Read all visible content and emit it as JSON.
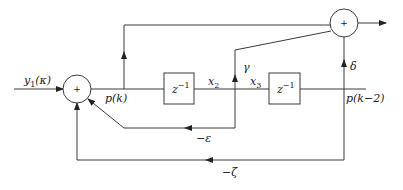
{
  "diagram": {
    "type": "block-diagram",
    "nodes": {
      "sum1": {
        "symbol": "+"
      },
      "sum2": {
        "symbol": "+"
      },
      "delay1": {
        "label_base": "z",
        "label_exp": "−1"
      },
      "delay2": {
        "label_base": "z",
        "label_exp": "−1"
      }
    },
    "labels": {
      "input": "y1(κ)",
      "input_base": "y",
      "input_sub": "1",
      "input_arg": "(κ)",
      "pk": "p(k)",
      "x2_base": "x",
      "x2_sub": "2",
      "x3_base": "x",
      "x3_sub": "3",
      "gamma": "γ",
      "delta": "δ",
      "pk2": "p(k−2)",
      "epsilon": "−ε",
      "zeta": "−ζ"
    },
    "edges": [
      {
        "from": "input",
        "to": "sum1"
      },
      {
        "from": "sum1",
        "to": "delay1",
        "label": "p(k)"
      },
      {
        "from": "p(k)",
        "to": "sum2"
      },
      {
        "from": "delay1",
        "to": "delay2",
        "label": "x2 / x3"
      },
      {
        "from": "x3",
        "to": "sum2",
        "gain": "γ"
      },
      {
        "from": "x3",
        "to": "sum1",
        "gain": "−ε"
      },
      {
        "from": "delay2",
        "to": "sum2",
        "label": "p(k−2)",
        "gain": "δ"
      },
      {
        "from": "p(k−2)",
        "to": "sum1",
        "gain": "−ζ"
      },
      {
        "from": "sum2",
        "to": "output"
      }
    ]
  }
}
